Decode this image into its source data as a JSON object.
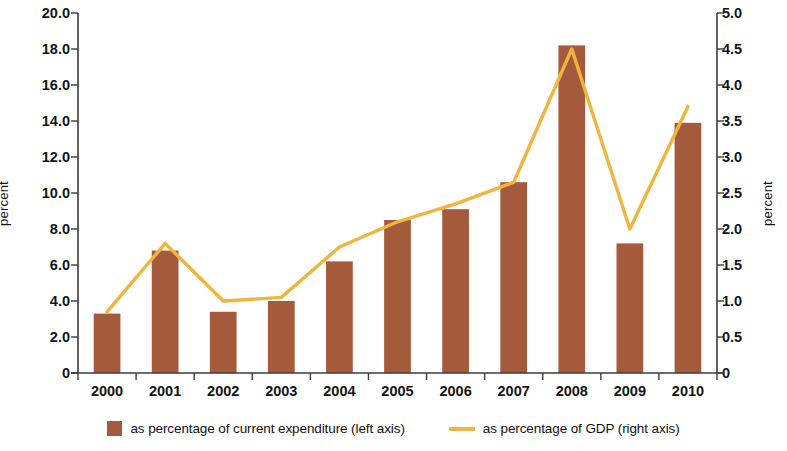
{
  "chart_data": {
    "type": "bar",
    "title": "",
    "subtitle": "",
    "xlabel": "",
    "ylabel": "percent",
    "ylabel_right": "percent",
    "categories": [
      "2000",
      "2001",
      "2002",
      "2003",
      "2004",
      "2005",
      "2006",
      "2007",
      "2008",
      "2009",
      "2010"
    ],
    "grid": false,
    "legend_position": "bottom",
    "axes": {
      "left": {
        "label": "percent",
        "min": 0,
        "max": 20,
        "step": 2,
        "ticks": [
          "0",
          "2.0",
          "4.0",
          "6.0",
          "8.0",
          "10.0",
          "12.0",
          "14.0",
          "16.0",
          "18.0",
          "20.0"
        ],
        "tick_values": [
          0,
          2,
          4,
          6,
          8,
          10,
          12,
          14,
          16,
          18,
          20
        ]
      },
      "right": {
        "label": "percent",
        "min": 0,
        "max": 5,
        "step": 0.5,
        "ticks": [
          "0",
          "0.5",
          "1.0",
          "1.5",
          "2.0",
          "2.5",
          "3.0",
          "3.5",
          "4.0",
          "4.5",
          "5.0"
        ],
        "tick_values": [
          0,
          0.5,
          1.0,
          1.5,
          2.0,
          2.5,
          3.0,
          3.5,
          4.0,
          4.5,
          5.0
        ]
      }
    },
    "series": [
      {
        "name": "as percentage of current expenditure (left axis)",
        "type": "bar",
        "axis": "left",
        "color": "#a55b3b",
        "values": [
          3.3,
          6.8,
          3.4,
          4.0,
          6.2,
          8.5,
          9.1,
          10.6,
          18.2,
          7.2,
          13.9
        ]
      },
      {
        "name": "as percentage of GDP (right axis)",
        "type": "line",
        "axis": "right",
        "color": "#f0b53f",
        "values": [
          0.85,
          1.8,
          1.0,
          1.05,
          1.75,
          2.1,
          2.35,
          2.65,
          4.5,
          2.0,
          3.7
        ]
      }
    ]
  },
  "legend": {
    "items": [
      {
        "label": "as percentage of current expenditure (left axis)",
        "marker": "bar-swatch",
        "color": "#a55b3b"
      },
      {
        "label": "as percentage of GDP (right axis)",
        "marker": "line-swatch",
        "color": "#f0b53f"
      }
    ]
  }
}
